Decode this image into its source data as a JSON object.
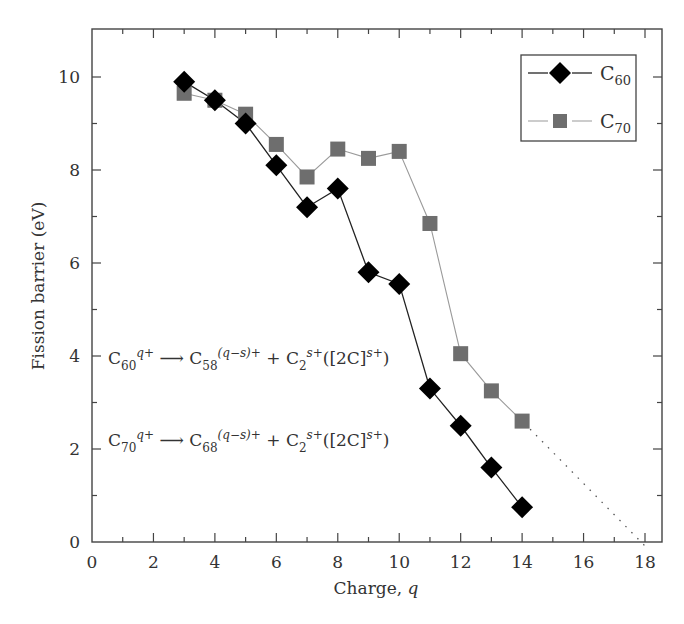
{
  "chart_data": {
    "type": "line",
    "title": "",
    "xlabel": "Charge, q",
    "ylabel": "Fission barrier (eV)",
    "xlim": [
      0,
      18.5
    ],
    "ylim": [
      0,
      11
    ],
    "x_ticks": [
      0,
      2,
      4,
      6,
      8,
      10,
      12,
      14,
      16,
      18
    ],
    "y_ticks": [
      0,
      2,
      4,
      6,
      8,
      10
    ],
    "grid": false,
    "legend_position": "upper right",
    "x": [
      3,
      4,
      5,
      6,
      7,
      8,
      9,
      10,
      11,
      12,
      13,
      14
    ],
    "series": [
      {
        "name": "C60",
        "marker": "diamond",
        "color": "#000000",
        "values": [
          9.9,
          9.5,
          9.0,
          8.1,
          7.2,
          7.6,
          5.8,
          5.55,
          3.3,
          2.5,
          1.6,
          0.75
        ]
      },
      {
        "name": "C70",
        "marker": "square",
        "color": "#6e6e6e",
        "values": [
          9.65,
          9.5,
          9.2,
          8.55,
          7.85,
          8.45,
          8.25,
          8.4,
          6.85,
          4.05,
          3.25,
          2.6
        ]
      }
    ],
    "extrapolation": {
      "series": "C70",
      "style": "dotted",
      "from": [
        14,
        2.6
      ],
      "to": [
        18,
        0
      ]
    },
    "annotations": [
      "C60^q+ → C58^(q−s)+ + C2^s+([2C]^s+)",
      "C70^q+ → C68^(q−s)+ + C2^s+([2C]^s+)"
    ]
  },
  "legend": {
    "c60": {
      "base": "C",
      "sub": "60"
    },
    "c70": {
      "base": "C",
      "sub": "70"
    }
  },
  "equations": {
    "eq1": {
      "lhs_base": "C",
      "lhs_sub": "60",
      "lhs_sup": "q+",
      "arrow": "⟶",
      "p1_base": "C",
      "p1_sub": "58",
      "p1_sup": "(q−s)+",
      "plus": " + ",
      "p2_base": "C",
      "p2_sub": "2",
      "p2_sup": "s+",
      "alt_open": "([2C]",
      "alt_sup": "s+",
      "alt_close": ")"
    },
    "eq2": {
      "lhs_base": "C",
      "lhs_sub": "70",
      "lhs_sup": "q+",
      "arrow": "⟶",
      "p1_base": "C",
      "p1_sub": "68",
      "p1_sup": "(q−s)+",
      "plus": " + ",
      "p2_base": "C",
      "p2_sub": "2",
      "p2_sup": "s+",
      "alt_open": "([2C]",
      "alt_sup": "s+",
      "alt_close": ")"
    }
  }
}
